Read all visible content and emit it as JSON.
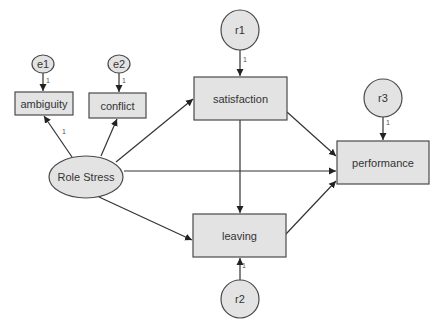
{
  "diagram": {
    "type": "structural-equation-model",
    "nodes": {
      "role_stress": {
        "label": "Role Stress",
        "shape": "ellipse"
      },
      "ambiguity": {
        "label": "ambiguity",
        "shape": "rect"
      },
      "conflict": {
        "label": "conflict",
        "shape": "rect"
      },
      "satisfaction": {
        "label": "satisfaction",
        "shape": "rect"
      },
      "leaving": {
        "label": "leaving",
        "shape": "rect"
      },
      "performance": {
        "label": "performance",
        "shape": "rect"
      },
      "e1": {
        "label": "e1",
        "shape": "ellipse"
      },
      "e2": {
        "label": "e2",
        "shape": "ellipse"
      },
      "r1": {
        "label": "r1",
        "shape": "ellipse"
      },
      "r2": {
        "label": "r2",
        "shape": "ellipse"
      },
      "r3": {
        "label": "r3",
        "shape": "ellipse"
      }
    },
    "edges": [
      {
        "from": "e1",
        "to": "ambiguity",
        "weight": "1"
      },
      {
        "from": "e2",
        "to": "conflict",
        "weight": "1"
      },
      {
        "from": "r1",
        "to": "satisfaction",
        "weight": "1"
      },
      {
        "from": "r2",
        "to": "leaving",
        "weight": "1"
      },
      {
        "from": "r3",
        "to": "performance",
        "weight": "1"
      },
      {
        "from": "role_stress",
        "to": "ambiguity",
        "weight": "1"
      },
      {
        "from": "role_stress",
        "to": "conflict",
        "weight": ""
      },
      {
        "from": "role_stress",
        "to": "satisfaction",
        "weight": ""
      },
      {
        "from": "role_stress",
        "to": "performance",
        "weight": ""
      },
      {
        "from": "role_stress",
        "to": "leaving",
        "weight": ""
      },
      {
        "from": "satisfaction",
        "to": "leaving",
        "weight": ""
      },
      {
        "from": "satisfaction",
        "to": "performance",
        "weight": ""
      },
      {
        "from": "leaving",
        "to": "performance",
        "weight": ""
      }
    ],
    "weights": {
      "e1_ambiguity": "1",
      "e2_conflict": "1",
      "r1_satisfaction": "1",
      "r2_leaving": "1",
      "r3_performance": "1",
      "rolestress_ambiguity": "1"
    }
  }
}
